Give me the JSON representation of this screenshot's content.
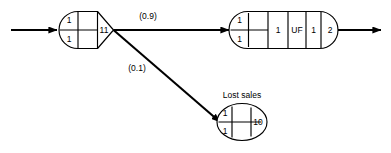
{
  "diagram": {
    "title": "",
    "background_color": "#ffffff",
    "stroke_color": "#000000",
    "nodes": [
      {
        "id": "queue-server-node",
        "shape": "rounded-left-pointed-right",
        "caption": "",
        "cells": [
          {
            "id": "n1-queue-top",
            "label": "1"
          },
          {
            "id": "n1-queue-bottom",
            "label": "1"
          },
          {
            "id": "n1-middle",
            "label": ""
          },
          {
            "id": "n1-server",
            "label": "11"
          }
        ]
      },
      {
        "id": "uf-node",
        "shape": "stadium",
        "caption": "",
        "cells": [
          {
            "id": "n2-queue-top",
            "label": "1"
          },
          {
            "id": "n2-queue-bottom",
            "label": "1"
          },
          {
            "id": "n2-blank",
            "label": ""
          },
          {
            "id": "n2-c1",
            "label": "1"
          },
          {
            "id": "n2-uf",
            "label": "UF"
          },
          {
            "id": "n2-c2",
            "label": "1"
          },
          {
            "id": "n2-c3",
            "label": "2"
          }
        ]
      },
      {
        "id": "lost-sales-node",
        "shape": "ellipse",
        "caption": "Lost sales",
        "cells": [
          {
            "id": "n3-queue-top",
            "label": "1"
          },
          {
            "id": "n3-queue-bottom",
            "label": "1"
          },
          {
            "id": "n3-blank",
            "label": ""
          },
          {
            "id": "n3-server",
            "label": "10"
          }
        ]
      }
    ],
    "edges": [
      {
        "id": "edge-entry",
        "label": "",
        "from": "source",
        "to": "queue-server-node"
      },
      {
        "id": "edge-to-uf",
        "label": "(0.9)",
        "from": "queue-server-node",
        "to": "uf-node"
      },
      {
        "id": "edge-to-lost-sales",
        "label": "(0.1)",
        "from": "queue-server-node",
        "to": "lost-sales-node"
      },
      {
        "id": "edge-exit",
        "label": "",
        "from": "uf-node",
        "to": "sink"
      }
    ]
  }
}
